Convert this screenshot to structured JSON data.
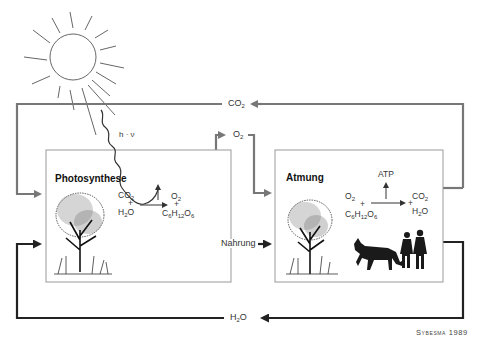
{
  "diagram": {
    "boxes": {
      "photosynthesis": {
        "title": "Photosynthese",
        "reactants": [
          "CO2",
          "+",
          "H2O"
        ],
        "products": [
          "O2",
          "+",
          "C6H12O6"
        ]
      },
      "respiration": {
        "title": "Atmung",
        "energy_output": "ATP",
        "reactants": [
          "O2",
          "+",
          "C6H12O6"
        ],
        "products": [
          "+",
          "CO2",
          "H2O"
        ]
      }
    },
    "flows": {
      "co2_label": "CO",
      "co2_sub": "2",
      "o2_label": "O",
      "o2_sub": "2",
      "food_label": "Nahrung",
      "h2o_label_h": "H",
      "h2o_sub": "2",
      "h2o_label_o": "O",
      "light_label": "h · ν"
    },
    "chem": {
      "ps_co2": "CO",
      "ps_co2_sub": "2",
      "plus": "+",
      "ps_h2o_h": "H",
      "ps_h2o_sub": "2",
      "ps_h2o_o": "O",
      "ps_o2": "O",
      "ps_o2_sub": "2",
      "glucose_c": "C",
      "glucose_c_sub": "6",
      "glucose_h": "H",
      "glucose_h_sub": "12",
      "glucose_o": "O",
      "glucose_o_sub": "6",
      "at_atp": "ATP",
      "at_o2": "O",
      "at_o2_sub": "2",
      "at_co2": "CO",
      "at_co2_sub": "2",
      "at_h2o_h": "H",
      "at_h2o_sub": "2",
      "at_h2o_o": "O"
    },
    "illustrations": [
      "sun",
      "tree",
      "tree",
      "dog",
      "two-people"
    ],
    "credit": "Sybesma 1989",
    "colors": {
      "gas_flow": "#777777",
      "water_food_flow": "#222222",
      "box_border": "#999999"
    }
  }
}
